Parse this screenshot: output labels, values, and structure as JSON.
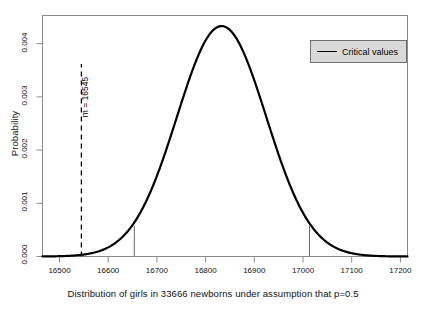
{
  "chart_data": {
    "type": "line",
    "title": "",
    "xlabel": "Distribution of girls in 33666 newborns under assumption that p=0.5",
    "ylabel": "Probability",
    "xlim": [
      16465,
      17215
    ],
    "ylim": [
      0.0,
      0.00455
    ],
    "xticks": [
      16500,
      16600,
      16700,
      16800,
      16900,
      17000,
      17100,
      17200
    ],
    "xtick_labels": [
      "16500",
      "16600",
      "16700",
      "16800",
      "16900",
      "17000",
      "17100",
      "17200"
    ],
    "yticks": [
      0.0,
      0.001,
      0.002,
      0.003,
      0.004
    ],
    "ytick_labels": [
      "0.000",
      "0.001",
      "0.002",
      "0.003",
      "0.004"
    ],
    "grid": false,
    "curve": {
      "name": "Binomial(33666, 0.5) normal approximation",
      "distribution": "normal",
      "mean": 16833,
      "sd": 91.7,
      "peak_x": 16833,
      "peak_y": 0.00435,
      "color": "#000000",
      "line_width": 2.2
    },
    "annotations": [
      {
        "name": "observed-value",
        "label": "m = 16545",
        "x": 16545,
        "style": "dashed",
        "color": "#000000"
      }
    ],
    "critical_values": {
      "values": [
        16653,
        17013
      ],
      "color": "#666666",
      "style": "solid",
      "y_top": 0.00056
    },
    "legend": {
      "position": "top-right",
      "entries": [
        {
          "label": "Critical values",
          "color": "#000000",
          "style": "line"
        }
      ],
      "background": "#d9d9d9",
      "border": "#6e6e6e"
    },
    "frame": {
      "color": "#8a8a8a",
      "box": true
    }
  }
}
